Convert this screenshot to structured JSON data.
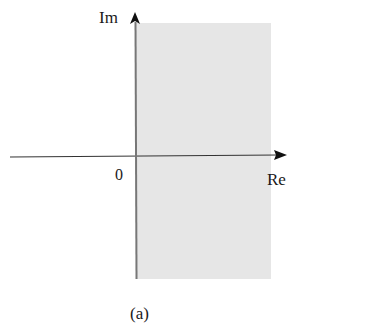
{
  "diagram": {
    "type": "complex-plane-region",
    "caption": "(a)",
    "axes": {
      "imaginary_label": "Im",
      "real_label": "Re",
      "origin_label": "0"
    },
    "region": {
      "description": "Right half-plane shaded (Re > 0)",
      "fill_color": "#e6e6e6"
    },
    "colors": {
      "axis": "#222222",
      "imag_axis": "#777777",
      "text": "#1a1a1a"
    }
  }
}
